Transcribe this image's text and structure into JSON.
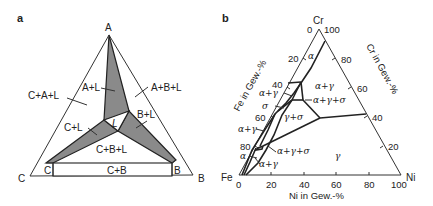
{
  "panel_a": {
    "label": "a",
    "vertices": {
      "top": "A",
      "left": "C",
      "right": "B"
    },
    "regions": {
      "c_a_l": "C+A+L",
      "a_l": "A+L",
      "a_b_l": "A+B+L",
      "c_l": "C+L",
      "l": "L",
      "b_l": "B+L",
      "c_b_l": "C+B+L",
      "c": "C",
      "c_b": "C+B",
      "b": "B"
    },
    "colors": {
      "shaded": "#8a8a8a",
      "line": "#222222"
    }
  },
  "panel_b": {
    "label": "b",
    "vertices": {
      "top": "Cr",
      "left": "Fe",
      "right": "Ni"
    },
    "axes": {
      "left": {
        "title": "Fe in Gew.-%",
        "ticks": [
          "0",
          "20",
          "40",
          "60",
          "80"
        ]
      },
      "right": {
        "title": "Cr in Gew.-%",
        "ticks": [
          "100",
          "80",
          "60",
          "40",
          "20"
        ]
      },
      "bottom": {
        "title": "Ni in Gew.-%",
        "ticks": [
          "0",
          "20",
          "40",
          "60",
          "80",
          "100"
        ]
      }
    },
    "regions": {
      "alpha_top": "α",
      "alpha_gamma_top": "α+γ",
      "alpha_gamma_left": "α+γ",
      "sigma": "σ",
      "alpha_gamma_sigma_top": "α+γ+σ",
      "gamma_sigma": "γ+σ",
      "alpha_gamma_mid": "α+γ",
      "alpha_gamma_sigma_low": "α+γ+σ",
      "gamma": "γ",
      "alpha_low": "α",
      "alpha_gamma_low": "α+γ"
    }
  }
}
